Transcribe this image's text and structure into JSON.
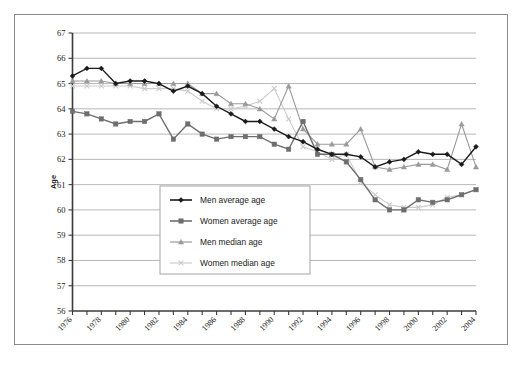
{
  "chart_data": {
    "type": "line",
    "title": "",
    "xlabel": "",
    "ylabel": "Age",
    "ylim": [
      56,
      67
    ],
    "xlim": [
      1976,
      2004
    ],
    "grid": true,
    "legend_position": "center-left-inside",
    "y_ticks": [
      56,
      57,
      58,
      59,
      60,
      61,
      62,
      63,
      64,
      65,
      66,
      67
    ],
    "x_ticks": [
      1976,
      1977,
      1978,
      1979,
      1980,
      1981,
      1982,
      1983,
      1984,
      1985,
      1986,
      1987,
      1988,
      1989,
      1990,
      1991,
      1992,
      1993,
      1994,
      1995,
      1996,
      1997,
      1998,
      1999,
      2000,
      2001,
      2002,
      2003,
      2004
    ],
    "x_tick_labels": [
      "1976",
      "",
      "1978",
      "",
      "1980",
      "",
      "1982",
      "",
      "1984",
      "",
      "1986",
      "",
      "1988",
      "",
      "1990",
      "",
      "1992",
      "",
      "1994",
      "",
      "1996",
      "",
      "1998",
      "",
      "2000",
      "",
      "2002",
      "",
      "2004"
    ],
    "x": [
      1976,
      1977,
      1978,
      1979,
      1980,
      1981,
      1982,
      1983,
      1984,
      1985,
      1986,
      1987,
      1988,
      1989,
      1990,
      1991,
      1992,
      1993,
      1994,
      1995,
      1996,
      1997,
      1998,
      1999,
      2000,
      2001,
      2002,
      2003,
      2004
    ],
    "series": [
      {
        "name": "Men average age",
        "marker": "diamond",
        "color": "#1a1a1a",
        "values": [
          65.3,
          65.6,
          65.6,
          65.0,
          65.1,
          65.1,
          65.0,
          64.7,
          64.9,
          64.6,
          64.1,
          63.8,
          63.5,
          63.5,
          63.2,
          62.9,
          62.7,
          62.4,
          62.2,
          62.2,
          62.1,
          61.7,
          61.9,
          62.0,
          62.3,
          62.2,
          62.2,
          61.8,
          62.5
        ]
      },
      {
        "name": "Women average age",
        "marker": "square",
        "color": "#6e6e6e",
        "values": [
          63.9,
          63.8,
          63.6,
          63.4,
          63.5,
          63.5,
          63.8,
          62.8,
          63.4,
          63.0,
          62.8,
          62.9,
          62.9,
          62.9,
          62.6,
          62.4,
          63.5,
          62.2,
          62.2,
          61.9,
          61.2,
          60.4,
          60.0,
          60.0,
          60.4,
          60.3,
          60.4,
          60.6,
          60.8
        ]
      },
      {
        "name": "Men median age",
        "marker": "triangle",
        "color": "#9a9a9a",
        "values": [
          65.1,
          65.1,
          65.1,
          65.0,
          65.0,
          65.0,
          65.0,
          65.0,
          65.0,
          64.6,
          64.6,
          64.2,
          64.2,
          64.0,
          63.6,
          64.9,
          63.2,
          62.6,
          62.6,
          62.6,
          63.2,
          61.7,
          61.6,
          61.7,
          61.8,
          61.8,
          61.6,
          63.4,
          61.7
        ]
      },
      {
        "name": "Women median age",
        "marker": "cross",
        "color": "#cccccc",
        "values": [
          64.9,
          64.9,
          64.9,
          64.9,
          64.9,
          64.8,
          64.8,
          64.8,
          64.7,
          64.3,
          64.0,
          64.0,
          64.1,
          64.3,
          64.8,
          63.6,
          62.5,
          62.3,
          62.0,
          62.2,
          61.1,
          60.6,
          60.2,
          60.1,
          60.1,
          60.2,
          60.5,
          60.6,
          60.8
        ]
      }
    ]
  },
  "legend": {
    "entries": [
      {
        "label": "Men average age"
      },
      {
        "label": "Women average age"
      },
      {
        "label": "Men median age"
      },
      {
        "label": "Women median age"
      }
    ]
  },
  "axes": {
    "y_axis_title": "Age"
  }
}
